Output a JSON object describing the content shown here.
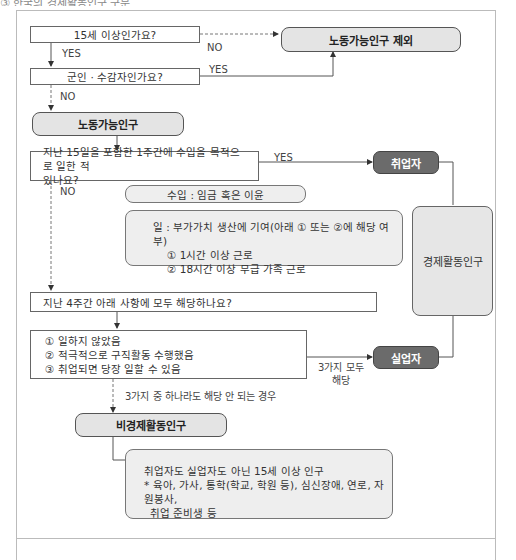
{
  "header": {
    "title": "③ 한국의 경제활동인구 구분"
  },
  "questions": {
    "age": "15세 이상인가요?",
    "military": "군인 · 수감자인가요?",
    "worked": "지난 15일을 포함한 1주간에 수입을 목적으로 일한 적 있나요?",
    "worked_line1": "지난 15일을 포함한 1주간에 수입을 목적으로 일한 적",
    "worked_line2": "있나요?",
    "four_weeks": "지난 4주간 아래 사항에 모두 해당하나요?"
  },
  "conditions": [
    "① 일하지 않았음",
    "② 적극적으로 구직활동 수행했음",
    "③ 취업되면 당장 일할 수 있음"
  ],
  "nodes": {
    "excluded": "노동가능인구 제외",
    "working_age": "노동가능인구",
    "employed": "취업자",
    "unemployed": "실업자",
    "economically_active": "경제활동인구",
    "not_active": "비경제활동인구"
  },
  "notes": {
    "income": "수입 : 임금 혹은 이윤",
    "work_title": "일 : 부가가치 생산에 기여(아래 ① 또는 ②에 해당 여부)",
    "work_items": [
      "① 1시간 이상 근로",
      "② 18시간 이상 무급 가족 근로"
    ],
    "not_active_line1": "취업자도 실업자도 아닌 15세 이상 인구",
    "not_active_line2": "* 육아, 가사, 통학(학교, 학원 등), 심신장애, 연로, 자원봉사,",
    "not_active_line3": "취업 준비생 등"
  },
  "edge_labels": {
    "yes1": "YES",
    "no1": "NO",
    "yes2": "YES",
    "no2": "NO",
    "yes3": "YES",
    "no3": "NO",
    "all_three_line1": "3가지 모두",
    "all_three_line2": "해당",
    "none": "3가지 중 하나라도 해당 안 되는 경우"
  },
  "colors": {
    "result_fill": "#e4e4e4",
    "dark_fill": "#6b6b6b",
    "note_fill": "#eeeeee",
    "line": "#555555"
  }
}
